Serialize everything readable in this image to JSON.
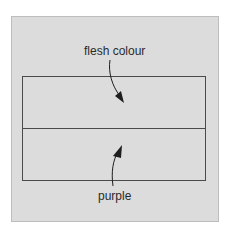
{
  "diagram": {
    "upper_label": "flesh colour",
    "lower_label": "purple",
    "colors": {
      "panel": "#dcdcdc",
      "lines": "#4a4a4a",
      "text": "#2a2a2a"
    }
  }
}
